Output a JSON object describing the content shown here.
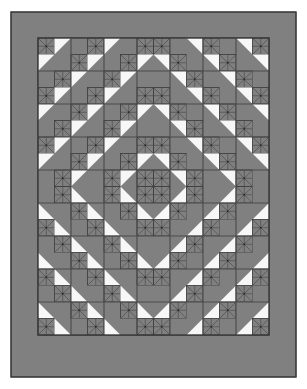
{
  "figure": {
    "name": "quilt-pattern-diagram",
    "kind": "quilt-layout-illustration",
    "canvas": {
      "width": 307,
      "height": 389,
      "background": "#ffffff"
    }
  },
  "colors": {
    "background": "#ffffff",
    "dark": "#808080",
    "light": "#f7f7f7",
    "outline": "#3a3a3a",
    "border_fill": "#808080",
    "seam_line": "#4a4a4a",
    "pinwheel_line": "#4a4a4a"
  },
  "layout": {
    "outer_frame": {
      "x": 11,
      "y": 12,
      "width": 285,
      "height": 365,
      "label": "outer-border"
    },
    "inner_panel": {
      "x": 38,
      "y": 38,
      "width": 231,
      "height": 297,
      "label": "pieced-center"
    },
    "border_width": 27,
    "grid": {
      "columns": 7,
      "rows": 9,
      "block_size": 33
    },
    "block_subunits": 2,
    "unit_size": 16.5
  },
  "pattern": {
    "name": "Diagonal Medallion Pinwheel Quilt",
    "block_name": "half-square-triangle block with pinwheel",
    "symmetry": "four-way mirror",
    "center_medallion": {
      "row": 4,
      "col": 3,
      "style": "on-point square with pinwheel center"
    },
    "unit_types": [
      "hst-dark",
      "hst-light",
      "pinwheel",
      "solid-dark"
    ],
    "legend": [
      {
        "key": "dark",
        "label": "Dark fabric",
        "color": "#808080"
      },
      {
        "key": "light",
        "label": "Light fabric",
        "color": "#f7f7f7"
      },
      {
        "key": "pinwheel",
        "label": "Pinwheel print block",
        "color": "#808080"
      }
    ]
  },
  "blocks": {
    "comment": "7 columns x 9 rows. Each cell is one of: 'P' pinwheel-corner block, 'D' all-dark block, 'L' light/dark HST block, 'C' center medallion. Orientation codes: tl/tr/bl/br indicate which corner carries the light triangle.",
    "rows": [
      [
        "Ptl",
        "Dtl",
        "Ptr",
        "Dtr",
        "Ptl",
        "Dtl",
        "Ptr"
      ],
      [
        "Dbl",
        "Ptl",
        "Dtl",
        "Ptr",
        "Dtr",
        "Ptl",
        "Dbr"
      ],
      [
        "Pbl",
        "Dbl",
        "Ptl",
        "Dtr",
        "Ptr",
        "Dbr",
        "Pbr"
      ],
      [
        "Dtl",
        "Ptr",
        "Dbl",
        "Ctr",
        "Dbr",
        "Ptl",
        "Dtr"
      ],
      [
        "Ptl",
        "Dtr",
        "Cbl",
        "CC",
        "Cbr",
        "Dtl",
        "Ptr"
      ],
      [
        "Dbl",
        "Pbr",
        "Dtl",
        "Cbr",
        "Dtr",
        "Pbl",
        "Dbr"
      ],
      [
        "Ptl",
        "Dtl",
        "Pbl",
        "Dbr",
        "Pbr",
        "Dtr",
        "Ptr"
      ],
      [
        "Dbl",
        "Pbl",
        "Dbl",
        "Pbr",
        "Dbr",
        "Pbr",
        "Dbr"
      ],
      [
        "Pbl",
        "Dbl",
        "Pbr",
        "Dbr",
        "Pbl",
        "Dbl",
        "Pbr"
      ]
    ]
  }
}
